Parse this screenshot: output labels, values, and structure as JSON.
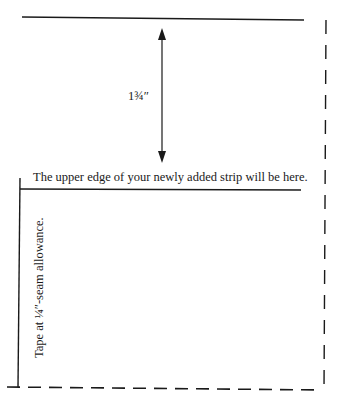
{
  "diagram": {
    "measurement_label": "1¾″",
    "upper_edge_note": "The upper edge of your newly added strip will be here.",
    "tape_note": "Tape at ¼″-seam allowance.",
    "bottom_fragment": "",
    "colors": {
      "line": "#1a1a1a",
      "background": "#ffffff"
    }
  }
}
